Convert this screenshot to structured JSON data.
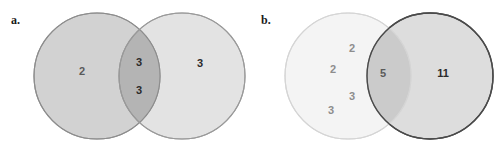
{
  "figure": {
    "type": "venn-diagram-pair",
    "background_color": "#ffffff",
    "width": 503,
    "height": 150
  },
  "panels": [
    {
      "id": "a",
      "label": "a.",
      "left_circle": {
        "name": "left-set",
        "fill_color": "#d2d2d2",
        "stroke_color": "#8d8d8d",
        "center_x": 97,
        "center_y": 76,
        "radius": 63
      },
      "right_circle": {
        "name": "right-set",
        "fill_color": "#e3e3e3",
        "stroke_color": "#9a9a9a",
        "center_x": 182,
        "center_y": 76,
        "radius": 63
      },
      "overlap": {
        "name": "intersection",
        "fill_color": "#b4b4b4",
        "stroke_color": "#8d8d8d"
      },
      "values": [
        {
          "name": "left-only-value",
          "text": "2",
          "region": "left-only",
          "x": 82,
          "y": 71,
          "tone": "mid"
        },
        {
          "name": "intersection-value-top",
          "text": "3",
          "region": "intersection",
          "x": 139,
          "y": 62,
          "tone": "dark"
        },
        {
          "name": "intersection-value-bottom",
          "text": "3",
          "region": "intersection",
          "x": 139,
          "y": 90,
          "tone": "dark"
        },
        {
          "name": "right-only-value",
          "text": "3",
          "region": "right-only",
          "x": 200,
          "y": 63,
          "tone": "dark"
        }
      ]
    },
    {
      "id": "b",
      "label": "b.",
      "left_circle": {
        "name": "left-set",
        "fill_color": "#f4f4f4",
        "stroke_color": "#d5d5d5",
        "center_x": 348,
        "center_y": 76,
        "radius": 63
      },
      "right_circle": {
        "name": "right-set",
        "fill_color": "#dddddd",
        "stroke_color": "#4a4a4a",
        "center_x": 430,
        "center_y": 76,
        "radius": 63
      },
      "overlap": {
        "name": "intersection",
        "fill_color": "#cbcbcb",
        "stroke_color": "#9b9b9b"
      },
      "values": [
        {
          "name": "left-only-value-1",
          "text": "2",
          "region": "left-only",
          "x": 352,
          "y": 48,
          "tone": "faint"
        },
        {
          "name": "left-only-value-2",
          "text": "2",
          "region": "left-only",
          "x": 333,
          "y": 69,
          "tone": "faint"
        },
        {
          "name": "left-only-value-3",
          "text": "3",
          "region": "left-only",
          "x": 352,
          "y": 96,
          "tone": "faint"
        },
        {
          "name": "left-only-value-4",
          "text": "3",
          "region": "left-only",
          "x": 331,
          "y": 110,
          "tone": "faint"
        },
        {
          "name": "intersection-value",
          "text": "5",
          "region": "intersection",
          "x": 383,
          "y": 73,
          "tone": "mid"
        },
        {
          "name": "right-only-value",
          "text": "11",
          "region": "right-only",
          "x": 443,
          "y": 73,
          "tone": "dark"
        }
      ]
    }
  ]
}
